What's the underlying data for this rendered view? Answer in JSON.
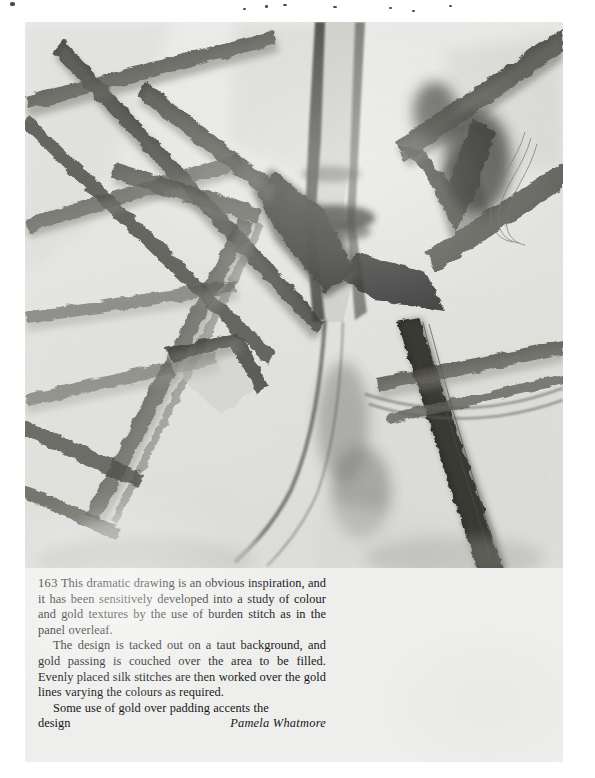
{
  "page": {
    "background_color": "#eeeeec",
    "scan_border_color": "#ffffff",
    "plate_background": "#e9e9e7",
    "ink_color": "#16161a"
  },
  "figure": {
    "number": "163",
    "medium": "charcoal drawing",
    "alt": "A dramatic charcoal drawing of crossing angular plant stems with dark shaded joints"
  },
  "caption": {
    "figure_number": "163",
    "paragraph_1": "This dramatic drawing is an obvious inspiration, and it has been sensitively developed into a study of colour and gold textures by the use of burden stitch as in the panel overleaf.",
    "paragraph_2": "The design is tacked out on a taut background, and gold passing is couched over the area to be filled. Evenly placed silk stitches are then worked over the gold lines varying the colours as required.",
    "paragraph_3_text": "Some use of gold over padding accents the",
    "paragraph_3_lastword": "design",
    "attribution": "Pamela Whatmore"
  }
}
